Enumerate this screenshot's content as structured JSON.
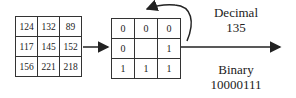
{
  "pixel_grid": {
    "rows": [
      [
        "124",
        "132",
        "89"
      ],
      [
        "117",
        "145",
        "152"
      ],
      [
        "156",
        "221",
        "218"
      ]
    ]
  },
  "binary_grid": {
    "rows": [
      [
        "0",
        "0",
        "0"
      ],
      [
        "0",
        "",
        "1"
      ],
      [
        "1",
        "1",
        "1"
      ]
    ]
  },
  "decimal": {
    "label": "Decimal",
    "value": "135"
  },
  "binary": {
    "label": "Binary",
    "value": "10000111"
  },
  "colors": {
    "stroke": "#222222",
    "background": "#ffffff"
  }
}
